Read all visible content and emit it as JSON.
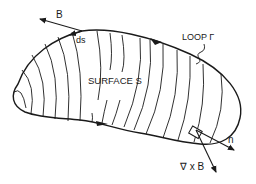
{
  "figure": {
    "labels": {
      "b_field": "B",
      "line_element": "ds",
      "loop": "LOOP Γ",
      "surface": "SURFACE S",
      "normal": "n",
      "curl": "∇ x B"
    },
    "colors": {
      "ink": "#1a1a1a",
      "background": "#ffffff"
    }
  }
}
